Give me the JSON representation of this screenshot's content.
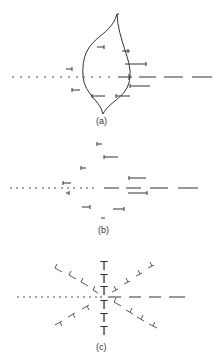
{
  "figure": {
    "panels": [
      {
        "id": "a",
        "label": "(a)",
        "axis_y": 77,
        "description": "lens-shaped grain boundary with dislocation symbols along a dotted/dashed line"
      },
      {
        "id": "b",
        "label": "(b)",
        "axis_y": 187,
        "description": "scattered dislocation segments about a dotted/dashed line"
      },
      {
        "id": "c",
        "label": "(c)",
        "axis_y": 297,
        "description": "radial star arrangement of dislocation T-symbols"
      }
    ]
  }
}
